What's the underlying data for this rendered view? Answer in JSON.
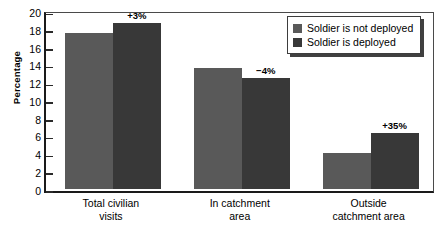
{
  "chart_data": {
    "type": "bar",
    "title": "",
    "xlabel": "",
    "ylabel": "Percentage",
    "ylim": [
      0,
      20
    ],
    "ytick_step": 2,
    "yticks": [
      "20",
      "18",
      "16",
      "14",
      "12",
      "10",
      "8",
      "6",
      "4",
      "2",
      "0"
    ],
    "grid": false,
    "legend_position": "top-right",
    "categories": [
      "Total civilian\nvisits",
      "In catchment\narea",
      "Outside\ncatchment area"
    ],
    "categories_display": [
      {
        "line1": "Total civilian",
        "line2": "visits"
      },
      {
        "line1": "In catchment",
        "line2": "area"
      },
      {
        "line1": "Outside",
        "line2": "catchment area"
      }
    ],
    "series": [
      {
        "name": "Soldier is not deployed",
        "color": "#595959",
        "values": [
          17.5,
          13.6,
          4.0
        ]
      },
      {
        "name": "Soldier is deployed",
        "color": "#383838",
        "values": [
          18.6,
          12.4,
          6.3
        ]
      }
    ],
    "annotations": [
      "+3%",
      "−4%",
      "+35%"
    ]
  },
  "legend": {
    "items": [
      {
        "label": "Soldier is not deployed",
        "color": "#595959"
      },
      {
        "label": "Soldier is deployed",
        "color": "#383838"
      }
    ]
  }
}
